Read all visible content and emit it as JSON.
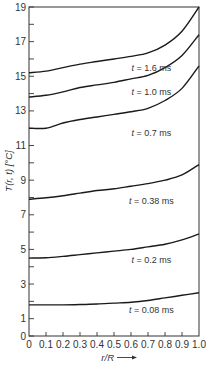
{
  "chart_data": {
    "type": "line",
    "title": "",
    "xlabel": "r/R",
    "ylabel": "T(r, t) [°C]",
    "xlim": [
      0,
      1.0
    ],
    "ylim": [
      0,
      19
    ],
    "grid": false,
    "legend": "inline labels below each curve",
    "x": [
      0,
      0.1,
      0.2,
      0.3,
      0.4,
      0.5,
      0.6,
      0.7,
      0.8,
      0.9,
      1.0
    ],
    "x_tick_labels": [
      "0",
      "0.1",
      "0.2",
      "0.3",
      "0.4",
      "0.5",
      "0.6",
      "0.7",
      "0.8",
      "0.9",
      "1.0"
    ],
    "y_tick_labels": [
      "0",
      "1",
      "3",
      "5",
      "7",
      "9",
      "11",
      "13",
      "15",
      "17",
      "19"
    ],
    "y_ticks": [
      0,
      1,
      2,
      3,
      4,
      5,
      6,
      7,
      8,
      9,
      10,
      11,
      12,
      13,
      14,
      15,
      16,
      17,
      18,
      19
    ],
    "series": [
      {
        "name": "t = 1.6 ms",
        "values": [
          15.2,
          15.3,
          15.5,
          15.7,
          15.85,
          16.0,
          16.15,
          16.35,
          16.8,
          17.6,
          19.0
        ],
        "label_x": 0.72,
        "label_y": 15.5
      },
      {
        "name": "t = 1.0 ms",
        "values": [
          13.8,
          13.9,
          14.1,
          14.35,
          14.5,
          14.65,
          14.85,
          15.05,
          15.5,
          16.2,
          17.4
        ],
        "label_x": 0.72,
        "label_y": 14.1
      },
      {
        "name": "t = 0.7 ms",
        "values": [
          12.0,
          12.0,
          12.3,
          12.5,
          12.65,
          12.8,
          12.95,
          13.15,
          13.6,
          14.3,
          15.6
        ],
        "label_x": 0.72,
        "label_y": 11.7
      },
      {
        "name": "t = 0.38 ms",
        "values": [
          7.9,
          7.98,
          8.1,
          8.25,
          8.4,
          8.5,
          8.65,
          8.8,
          9.0,
          9.3,
          9.9
        ],
        "label_x": 0.72,
        "label_y": 7.8
      },
      {
        "name": "t = 0.2 ms",
        "values": [
          4.5,
          4.52,
          4.6,
          4.7,
          4.8,
          4.9,
          5.0,
          5.15,
          5.3,
          5.55,
          5.9
        ],
        "label_x": 0.72,
        "label_y": 4.4
      },
      {
        "name": "t = 0.08 ms",
        "values": [
          1.8,
          1.8,
          1.8,
          1.82,
          1.85,
          1.9,
          1.95,
          2.05,
          2.2,
          2.35,
          2.5
        ],
        "label_x": 0.72,
        "label_y": 1.5
      }
    ]
  },
  "labels": {
    "ylabel": "T(r, t) [°C]",
    "xlabel": "r/R"
  }
}
